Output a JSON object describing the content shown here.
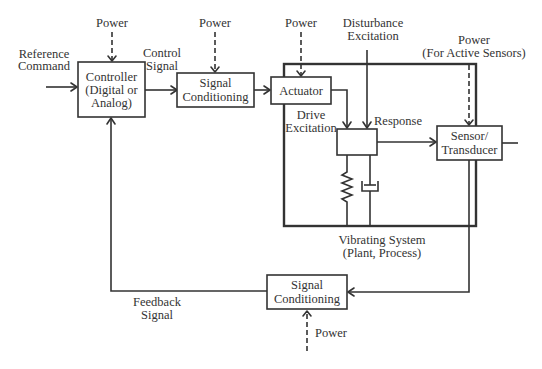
{
  "diagram": {
    "type": "vibration-control-block-diagram",
    "colors": {
      "line": "#333333",
      "background": "#ffffff"
    },
    "blocks": {
      "controller": {
        "lines": [
          "Controller",
          "(Digital or",
          "Analog)"
        ]
      },
      "signal_conditioning_forward": {
        "lines": [
          "Signal",
          "Conditioning"
        ]
      },
      "actuator": {
        "lines": [
          "Actuator"
        ]
      },
      "sensor": {
        "lines": [
          "Sensor/",
          "Transducer"
        ]
      },
      "signal_conditioning_feedback": {
        "lines": [
          "Signal",
          "Conditioning"
        ]
      },
      "plant": {
        "caption": [
          "Vibrating System",
          "(Plant, Process)"
        ]
      }
    },
    "labels": {
      "reference_command": [
        "Reference",
        "Command"
      ],
      "control_signal": [
        "Control",
        "Signal"
      ],
      "drive_excitation": [
        "Drive",
        "Excitation"
      ],
      "disturbance_excitation": [
        "Disturbance",
        "Excitation"
      ],
      "response": "Response",
      "feedback_signal": [
        "Feedback",
        "Signal"
      ],
      "power_controller": "Power",
      "power_signal_conditioning": "Power",
      "power_actuator": "Power",
      "power_sensor": [
        "Power",
        "(For Active Sensors)"
      ],
      "power_feedback_conditioning": "Power"
    }
  }
}
